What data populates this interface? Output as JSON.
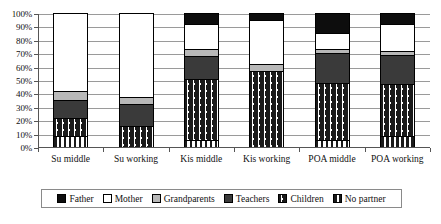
{
  "chart_data": {
    "type": "bar",
    "variant": "stacked-100-percent",
    "title": "",
    "xlabel": "",
    "ylabel": "",
    "ylim": [
      0,
      100
    ],
    "ytick_labels": [
      "0%",
      "10%",
      "20%",
      "30%",
      "40%",
      "50%",
      "60%",
      "70%",
      "80%",
      "90%",
      "100%"
    ],
    "ytick_values": [
      0,
      10,
      20,
      30,
      40,
      50,
      60,
      70,
      80,
      90,
      100
    ],
    "grid": true,
    "legend_position": "bottom",
    "categories": [
      "Su middle",
      "Su working",
      "Kis middle",
      "Kis working",
      "POA middle",
      "POA working"
    ],
    "series": [
      {
        "name": "Father",
        "color": "#0d0d0d",
        "pattern": "solid",
        "values": [
          0,
          0,
          8,
          5,
          15,
          8
        ]
      },
      {
        "name": "Mother",
        "color": "#ffffff",
        "pattern": "solid",
        "values": [
          58,
          63,
          19,
          33,
          12,
          20
        ]
      },
      {
        "name": "Grandparents",
        "color": "#b8b8b8",
        "pattern": "solid",
        "values": [
          7,
          5,
          5,
          5,
          3,
          3
        ]
      },
      {
        "name": "Teachers",
        "color": "#3a3a3a",
        "pattern": "solid",
        "values": [
          13,
          16,
          17,
          0,
          22,
          22
        ]
      },
      {
        "name": "Children",
        "color": "#1a1a1a",
        "pattern": "dotted-grid",
        "values": [
          14,
          16,
          46,
          57,
          43,
          39
        ]
      },
      {
        "name": "No partner",
        "color": "#1a1a1a",
        "pattern": "vertical-stripe",
        "values": [
          8,
          0,
          5,
          0,
          5,
          8
        ]
      }
    ]
  },
  "legend": {
    "items": [
      {
        "label": "Father",
        "swatch": "father-swatch"
      },
      {
        "label": "Mother",
        "swatch": "mother-swatch"
      },
      {
        "label": "Grandparents",
        "swatch": "grandparents-swatch"
      },
      {
        "label": "Teachers",
        "swatch": "teachers-swatch"
      },
      {
        "label": "Children",
        "swatch": "children-swatch"
      },
      {
        "label": "No partner",
        "swatch": "no-partner-swatch"
      }
    ]
  }
}
